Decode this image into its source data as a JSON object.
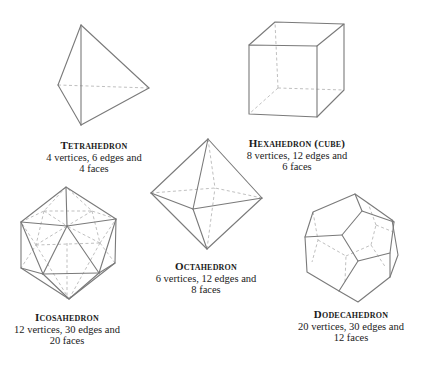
{
  "figure": {
    "colors": {
      "edge": "#7a7a7a",
      "hidden_edge": "#b8b8b8",
      "text": "#1a1a1a",
      "background": "#ffffff"
    }
  },
  "solids": [
    {
      "id": "tetrahedron",
      "name": "Tetrahedron",
      "line1": "4 vertices, 6 edges and",
      "line2": "4 faces",
      "vertices": 4,
      "edges": 6,
      "faces": 4
    },
    {
      "id": "hexahedron",
      "name": "Hexahedron (cube)",
      "line1": "8 vertices, 12 edges and",
      "line2": "6 faces",
      "vertices": 8,
      "edges": 12,
      "faces": 6
    },
    {
      "id": "octahedron",
      "name": "Octahedron",
      "line1": "6 vertices, 12 edges and",
      "line2": "8 faces",
      "vertices": 6,
      "edges": 12,
      "faces": 8
    },
    {
      "id": "icosahedron",
      "name": "Icosahedron",
      "line1": "12 vertices, 30 edges and",
      "line2": "20 faces",
      "vertices": 12,
      "edges": 30,
      "faces": 20
    },
    {
      "id": "dodecahedron",
      "name": "Dodecahedron",
      "line1": "20 vertices, 30 edges and",
      "line2": "12 faces",
      "vertices": 20,
      "edges": 30,
      "faces": 12
    }
  ]
}
